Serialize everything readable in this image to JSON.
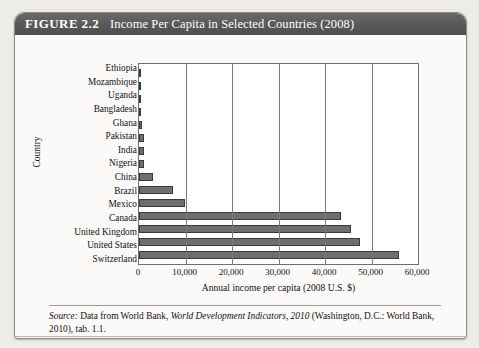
{
  "figure": {
    "label": "FIGURE 2.2",
    "title": "Income Per Capita in Selected Countries (2008)"
  },
  "source": {
    "prefix": "Source:",
    "text_before_italic": " Data from World Bank, ",
    "italic_text": "World Development Indicators, 2010",
    "text_after_italic": " (Washington, D.C.: World Bank, 2010), tab. 1.1."
  },
  "chart_data": {
    "type": "bar",
    "orientation": "horizontal",
    "title": "Income Per Capita in Selected Countries (2008)",
    "xlabel": "Annual income per capita (2008 U.S. $)",
    "ylabel": "Country",
    "xlim": [
      0,
      60000
    ],
    "xticks": [
      0,
      10000,
      20000,
      30000,
      40000,
      50000,
      60000
    ],
    "xticklabels": [
      "0",
      "10,000",
      "20,000",
      "30,000",
      "40,000",
      "50,000",
      "60,000"
    ],
    "grid": true,
    "legend": false,
    "bar_color": "#6e6e6e",
    "bar_edge_color": "#3a3a3a",
    "categories": [
      "Ethiopia",
      "Mozambique",
      "Uganda",
      "Bangladesh",
      "Ghana",
      "Pakistan",
      "India",
      "Nigeria",
      "China",
      "Brazil",
      "Mexico",
      "Canada",
      "United Kingdom",
      "United States",
      "Switzerland"
    ],
    "values": [
      280,
      370,
      420,
      500,
      670,
      980,
      1020,
      1160,
      3000,
      7300,
      9900,
      43500,
      45500,
      47500,
      56000
    ]
  }
}
